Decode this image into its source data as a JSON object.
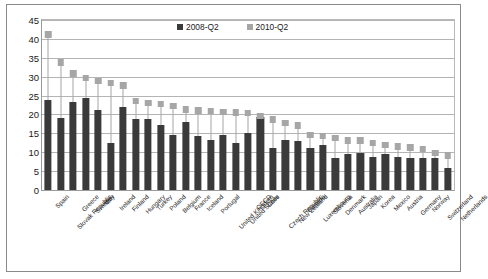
{
  "chart_data": {
    "type": "bar",
    "title": "",
    "subtitle": "",
    "xlabel": "",
    "ylabel": "",
    "ylim": [
      0,
      45
    ],
    "ytick_step": 5,
    "yticks": [
      0,
      5,
      10,
      15,
      20,
      25,
      30,
      35,
      40,
      45
    ],
    "grid": true,
    "legend_position": "top-center",
    "categories": [
      "Spain",
      "Slovak Republic",
      "Greece",
      "Sweden",
      "Italy",
      "Ireland",
      "Finland",
      "Hungary",
      "Turkey",
      "Poland",
      "Belgium",
      "France",
      "Iceland",
      "Portugal",
      "United Kingdom",
      "United States",
      "OECD",
      "Chile",
      "Czech Republic",
      "New Zealand",
      "Canada",
      "Luxembourg",
      "Slovenia",
      "Denmark",
      "Australia",
      "Japan",
      "Korea",
      "Mexico",
      "Austria",
      "Germany",
      "Norway",
      "Switzerland",
      "Netherlands"
    ],
    "series": [
      {
        "name": "2008-Q2",
        "color": "#3a3a3a",
        "marker": "bar",
        "values": [
          23.8,
          19.0,
          23.3,
          24.4,
          21.1,
          12.5,
          22.1,
          18.9,
          18.7,
          17.3,
          14.5,
          17.9,
          14.4,
          13.3,
          14.6,
          12.5,
          15.0,
          19.2,
          11.0,
          13.2,
          13.1,
          11.0,
          12.0,
          8.6,
          9.5,
          9.8,
          8.7,
          9.6,
          8.8,
          8.6,
          8.4,
          8.6,
          5.9
        ]
      },
      {
        "name": "2010-Q2",
        "color": "#a6a6a6",
        "marker": "square",
        "values": [
          41.2,
          33.7,
          30.9,
          29.7,
          28.9,
          28.3,
          27.6,
          23.6,
          23.0,
          22.8,
          22.2,
          21.3,
          21.0,
          20.9,
          20.6,
          20.5,
          20.4,
          19.6,
          18.6,
          17.7,
          17.1,
          14.6,
          14.3,
          13.8,
          13.1,
          13.1,
          12.4,
          11.9,
          11.5,
          11.2,
          10.8,
          9.8,
          9.2
        ]
      }
    ]
  },
  "legend": {
    "entries": [
      {
        "label": "2008-Q2",
        "color": "#3a3a3a"
      },
      {
        "label": "2010-Q2",
        "color": "#a6a6a6"
      }
    ]
  }
}
